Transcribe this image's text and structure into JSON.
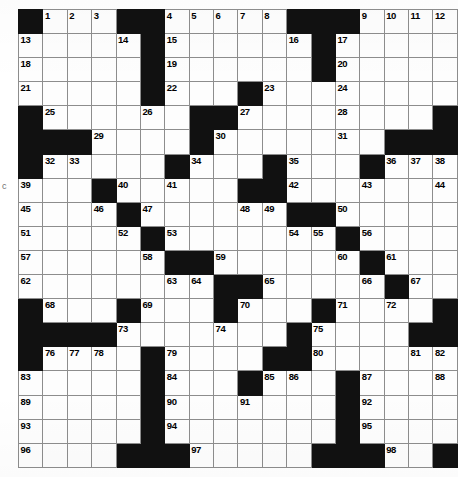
{
  "puzzle": {
    "kind": "crossword-grid",
    "rows": 20,
    "cols": 18,
    "cell_size_px": 23,
    "colors": {
      "block": "#111111",
      "cell": "#fdfdfd",
      "gridline": "#8d8d8d",
      "border": "#2b2b2b",
      "number": "#000000"
    },
    "edge_artifact": "c",
    "highest_number": 98,
    "grid": [
      [
        "#",
        "1",
        "2",
        "3",
        "#",
        "#",
        "4",
        "5",
        "6",
        "7",
        "8",
        "#",
        "#",
        "#",
        "9",
        "10",
        "11",
        "12"
      ],
      [
        "13",
        "",
        "",
        "",
        "14",
        "#",
        "15",
        "",
        "",
        "",
        "",
        "16",
        "#",
        "17",
        "",
        "",
        "",
        ""
      ],
      [
        "18",
        "",
        "",
        "",
        "",
        "#",
        "19",
        "",
        "",
        "",
        "",
        "",
        "#",
        "20",
        "",
        "",
        "",
        ""
      ],
      [
        "21",
        "",
        "",
        "",
        "",
        "#",
        "22",
        "",
        "",
        "#",
        "23",
        "",
        "",
        "24",
        "",
        "",
        "",
        ""
      ],
      [
        "#",
        "25",
        "",
        "",
        "",
        "26",
        "",
        "#",
        "#",
        "27",
        "",
        "",
        "",
        "28",
        "",
        "",
        "",
        "#"
      ],
      [
        "#",
        "#",
        "#",
        "29",
        "",
        "",
        "",
        "#",
        "30",
        "",
        "",
        "",
        "",
        "31",
        "",
        "#",
        "#",
        "#"
      ],
      [
        "#",
        "32",
        "33",
        "",
        "",
        "",
        "#",
        "34",
        "",
        "",
        "#",
        "35",
        "",
        "",
        "#",
        "36",
        "37",
        "38"
      ],
      [
        "39",
        "",
        "",
        "#",
        "40",
        "",
        "41",
        "",
        "",
        "#",
        "#",
        "42",
        "",
        "",
        "43",
        "",
        "",
        "44"
      ],
      [
        "45",
        "",
        "",
        "46",
        "#",
        "47",
        "",
        "",
        "",
        "48",
        "49",
        "#",
        "#",
        "50",
        "",
        "",
        "",
        ""
      ],
      [
        "51",
        "",
        "",
        "",
        "52",
        "#",
        "53",
        "",
        "",
        "",
        "",
        "54",
        "55",
        "#",
        "56",
        "",
        "",
        ""
      ],
      [
        "57",
        "",
        "",
        "",
        "",
        "58",
        "#",
        "#",
        "59",
        "",
        "",
        "",
        "",
        "60",
        "#",
        "61",
        "",
        ""
      ],
      [
        "62",
        "",
        "",
        "",
        "",
        "",
        "63",
        "64",
        "#",
        "#",
        "65",
        "",
        "",
        "",
        "66",
        "#",
        "67",
        ""
      ],
      [
        "#",
        "68",
        "",
        "",
        "#",
        "69",
        "",
        "",
        "#",
        "70",
        "",
        "",
        "#",
        "71",
        "",
        "72",
        "",
        "#"
      ],
      [
        "#",
        "#",
        "#",
        "#",
        "73",
        "",
        "",
        "",
        "74",
        "",
        "",
        "#",
        "75",
        "",
        "",
        "",
        "#",
        "#"
      ],
      [
        "#",
        "76",
        "77",
        "78",
        "",
        "#",
        "79",
        "",
        "",
        "",
        "#",
        "#",
        "80",
        "",
        "",
        "",
        "81",
        "82"
      ],
      [
        "83",
        "",
        "",
        "",
        "",
        "#",
        "84",
        "",
        "",
        "#",
        "85",
        "86",
        "",
        "#",
        "87",
        "",
        "",
        "88"
      ],
      [
        "89",
        "",
        "",
        "",
        "",
        "#",
        "90",
        "",
        "",
        "91",
        "",
        "",
        "",
        "#",
        "92",
        "",
        "",
        ""
      ],
      [
        "93",
        "",
        "",
        "",
        "",
        "#",
        "94",
        "",
        "",
        "",
        "",
        "",
        "",
        "#",
        "95",
        "",
        "",
        ""
      ],
      [
        "96",
        "",
        "",
        "",
        "#",
        "#",
        "#",
        "97",
        "",
        "",
        "",
        "",
        "#",
        "#",
        "#",
        "98",
        "",
        "#"
      ]
    ]
  }
}
